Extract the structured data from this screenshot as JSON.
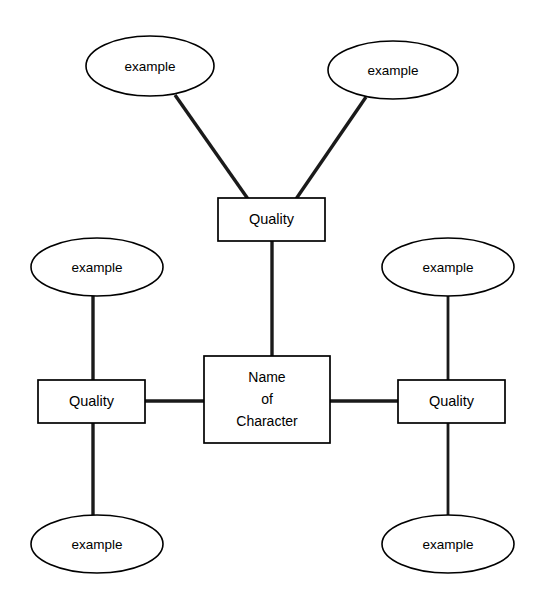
{
  "diagram": {
    "type": "character-quality-web",
    "center": {
      "id": "center-node",
      "shape": "rectangle",
      "line1": "Name",
      "line2": "of",
      "line3": "Character"
    },
    "qualities": [
      {
        "id": "quality-top",
        "label": "Quality",
        "position": "top"
      },
      {
        "id": "quality-left",
        "label": "Quality",
        "position": "left"
      },
      {
        "id": "quality-right",
        "label": "Quality",
        "position": "right"
      }
    ],
    "examples": [
      {
        "id": "example-top-left",
        "label": "example",
        "position": "top-left"
      },
      {
        "id": "example-top-right",
        "label": "example",
        "position": "top-right"
      },
      {
        "id": "example-left-upper",
        "label": "example",
        "position": "left-upper"
      },
      {
        "id": "example-right-upper",
        "label": "example",
        "position": "right-upper"
      },
      {
        "id": "example-left-lower",
        "label": "example",
        "position": "left-lower"
      },
      {
        "id": "example-right-lower",
        "label": "example",
        "position": "right-lower"
      }
    ],
    "colors": {
      "background": "#ffffff",
      "stroke": "#000000",
      "connector": "#1a1a1a",
      "text": "#000000"
    }
  }
}
